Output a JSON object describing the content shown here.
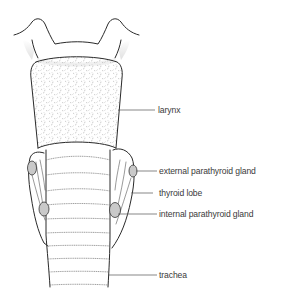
{
  "diagram": {
    "labels": [
      {
        "id": "larynx",
        "text": "larynx"
      },
      {
        "id": "external-parathyroid",
        "text": "external parathyroid gland"
      },
      {
        "id": "thyroid-lobe",
        "text": "thyroid lobe"
      },
      {
        "id": "internal-parathyroid",
        "text": "internal parathyroid gland"
      },
      {
        "id": "trachea",
        "text": "trachea"
      }
    ],
    "colors": {
      "outline": "#2a2a2a",
      "gland_fill": "#c9c9c9",
      "text": "#3a3a3a",
      "background": "#ffffff"
    }
  }
}
